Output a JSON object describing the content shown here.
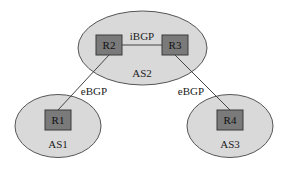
{
  "diagram": {
    "type": "bgp-topology",
    "colors": {
      "as_fill": "#d9d9d9",
      "as_stroke": "#555555",
      "router_fill": "#7a7a7a",
      "router_stroke": "#3a3a3a",
      "link": "#444444",
      "text": "#222222"
    },
    "autonomous_systems": [
      {
        "id": "as1",
        "label": "AS1"
      },
      {
        "id": "as2",
        "label": "AS2"
      },
      {
        "id": "as3",
        "label": "AS3"
      }
    ],
    "routers": [
      {
        "id": "r1",
        "label": "R1",
        "as": "AS1"
      },
      {
        "id": "r2",
        "label": "R2",
        "as": "AS2"
      },
      {
        "id": "r3",
        "label": "R3",
        "as": "AS2"
      },
      {
        "id": "r4",
        "label": "R4",
        "as": "AS3"
      }
    ],
    "links": [
      {
        "from": "R2",
        "to": "R3",
        "label": "iBGP"
      },
      {
        "from": "R2",
        "to": "R1",
        "label": "eBGP"
      },
      {
        "from": "R3",
        "to": "R4",
        "label": "eBGP"
      }
    ]
  }
}
